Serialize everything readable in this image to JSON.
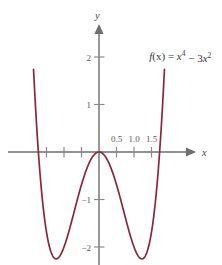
{
  "figure": {
    "background_color": "#ffffff",
    "width": 222,
    "height": 265
  },
  "axes": {
    "x_axis_label": "x",
    "y_axis_label": "y",
    "axis_color": "#6e6e70",
    "tick_color": "#8a8a8c",
    "tick_label_color": "#58585a",
    "x_tick_labels": [
      "0.5",
      "1.0",
      "1.5"
    ],
    "y_tick_labels": [
      "2",
      "1",
      "−1",
      "−2"
    ]
  },
  "annotation": {
    "function_label_plain": "f(x) = x⁴ − 3x²",
    "f_part": "f",
    "paren_x_part": "(x)",
    "equals_part": " = ",
    "x_part": "x",
    "exp_4": "4",
    "minus_part": " − 3",
    "x_part_2": "x",
    "exp_2": "2",
    "color": "#3a3a3c"
  },
  "chart_data": {
    "type": "line",
    "title": "",
    "subtitle": "",
    "xlabel": "x",
    "ylabel": "y",
    "function": "f(x) = x^4 - 3x^2",
    "curve_color": "#8B2838",
    "grid": false,
    "legend": "none",
    "annotations": [
      "f(x) = x⁴ − 3x²"
    ],
    "xlim": [
      -2.1,
      2.1
    ],
    "ylim": [
      -2.45,
      2.6
    ],
    "x_ticks": [
      -1.5,
      -1.0,
      -0.5,
      0.5,
      1.0,
      1.5
    ],
    "x_tick_labels": [
      "",
      "",
      "",
      "0.5",
      "1.0",
      "1.5"
    ],
    "y_ticks": [
      2,
      1,
      -1,
      -2
    ],
    "y_tick_labels": [
      "2",
      "1",
      "−1",
      "−2"
    ],
    "x": [
      -2.0,
      -1.95,
      -1.9,
      -1.85,
      -1.8,
      -1.75,
      -1.7,
      -1.65,
      -1.6,
      -1.55,
      -1.5,
      -1.45,
      -1.4,
      -1.35,
      -1.3,
      -1.25,
      -1.2,
      -1.15,
      -1.1,
      -1.05,
      -1.0,
      -0.95,
      -0.9,
      -0.85,
      -0.8,
      -0.75,
      -0.7,
      -0.65,
      -0.6,
      -0.55,
      -0.5,
      -0.45,
      -0.4,
      -0.35,
      -0.3,
      -0.25,
      -0.2,
      -0.15,
      -0.1,
      -0.05,
      0.0,
      0.05,
      0.1,
      0.15,
      0.2,
      0.25,
      0.3,
      0.35,
      0.4,
      0.45,
      0.5,
      0.55,
      0.6,
      0.65,
      0.7,
      0.75,
      0.8,
      0.85,
      0.9,
      0.95,
      1.0,
      1.05,
      1.1,
      1.15,
      1.2,
      1.25,
      1.3,
      1.35,
      1.4,
      1.45,
      1.5,
      1.55,
      1.6,
      1.65,
      1.7,
      1.75,
      1.8,
      1.85,
      1.9,
      1.95,
      2.0
    ],
    "y": [
      4.0,
      3.045,
      2.202,
      1.447,
      0.778,
      0.191,
      -0.316,
      -0.751,
      -0.614,
      -1.437,
      -1.688,
      -1.888,
      -2.042,
      -2.147,
      -2.211,
      -2.238,
      -2.232,
      -2.219,
      -2.166,
      -2.092,
      -2.0,
      -1.893,
      -1.774,
      -1.645,
      -1.51,
      -1.371,
      -1.23,
      -1.089,
      -0.952,
      -0.819,
      -0.688,
      -0.567,
      -0.454,
      -0.352,
      -0.262,
      -0.184,
      -0.119,
      -0.067,
      -0.03,
      -0.007,
      0.0,
      -0.007,
      -0.03,
      -0.067,
      -0.119,
      -0.184,
      -0.262,
      -0.352,
      -0.454,
      -0.567,
      -0.688,
      -0.819,
      -0.952,
      -1.089,
      -1.23,
      -1.371,
      -1.51,
      -1.645,
      -1.774,
      -1.893,
      -2.0,
      -2.092,
      -2.166,
      -2.219,
      -2.232,
      -2.238,
      -2.211,
      -2.147,
      -2.042,
      -1.888,
      -1.688,
      -1.437,
      -1.131,
      -0.77,
      -0.346,
      0.191,
      0.778,
      1.447,
      2.202,
      3.045,
      4.0
    ],
    "minima": [
      {
        "x": -1.2247,
        "y": -2.25
      },
      {
        "x": 1.2247,
        "y": -2.25
      }
    ],
    "local_max": [
      {
        "x": 0,
        "y": 0
      }
    ],
    "roots": [
      -1.7321,
      0,
      1.7321
    ]
  }
}
